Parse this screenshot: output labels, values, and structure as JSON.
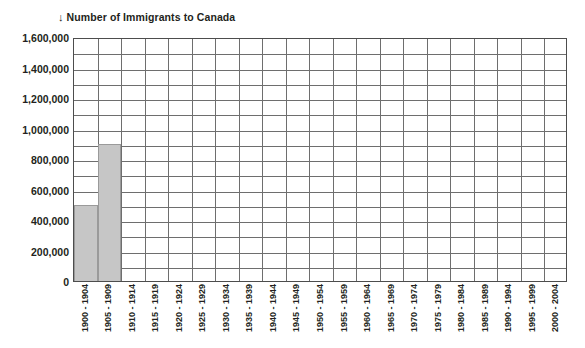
{
  "chart_data": {
    "type": "bar",
    "title_arrow_glyph": "↓",
    "title_text": "Number of Immigrants to Canada",
    "xlabel": "",
    "ylabel": "",
    "ylim": [
      0,
      1600000
    ],
    "grid": true,
    "legend": false,
    "bar_color": "#c6c6c6",
    "bar_border_color": "#9a9a9a",
    "grid_color": "#6e6e6e",
    "axis_color": "#4d4d4d",
    "text_color": "#231f20",
    "y_major_step": 200000,
    "y_minor_step": 100000,
    "y_tick_labels": [
      "0",
      "200,000",
      "400,000",
      "600,000",
      "800,000",
      "1,000,000",
      "1,200,000",
      "1,400,000",
      "1,600,000"
    ],
    "y_tick_values": [
      0,
      200000,
      400000,
      600000,
      800000,
      1000000,
      1200000,
      1400000,
      1600000
    ],
    "categories": [
      "1900 - 1904",
      "1905 - 1909",
      "1910 - 1914",
      "1915 - 1919",
      "1920 - 1924",
      "1925 - 1929",
      "1930 - 1934",
      "1935 - 1939",
      "1940 - 1944",
      "1945 - 1949",
      "1950 - 1954",
      "1955 - 1959",
      "1960 - 1964",
      "1965 - 1969",
      "1970 - 1974",
      "1975 - 1979",
      "1980 - 1984",
      "1985 - 1989",
      "1990 - 1994",
      "1995 - 1999",
      "2000 - 2004"
    ],
    "values": [
      500000,
      900000,
      null,
      null,
      null,
      null,
      null,
      null,
      null,
      null,
      null,
      null,
      null,
      null,
      null,
      null,
      null,
      null,
      null,
      null,
      null
    ]
  }
}
